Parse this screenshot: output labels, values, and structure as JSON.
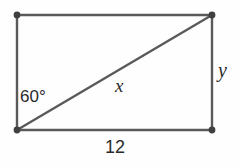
{
  "figure": {
    "type": "geometry-diagram",
    "shape": "rectangle-with-diagonal",
    "background_color": "#fefefe",
    "stroke_color": "#5a5a5a",
    "vertex_color": "#404040",
    "text_color": "#2b2b2b",
    "stroke_width": 2.4,
    "rectangle": {
      "top_left": [
        17,
        15
      ],
      "top_right": [
        212,
        15
      ],
      "bottom_right": [
        212,
        130
      ],
      "bottom_left": [
        17,
        130
      ]
    },
    "diagonal": {
      "from": [
        17,
        130
      ],
      "to": [
        212,
        15
      ]
    },
    "vertices": [
      {
        "name": "top-left",
        "x": 17,
        "y": 15
      },
      {
        "name": "top-right",
        "x": 212,
        "y": 15
      },
      {
        "name": "bottom-right",
        "x": 212,
        "y": 130
      },
      {
        "name": "bottom-left",
        "x": 17,
        "y": 130
      }
    ],
    "labels": {
      "angle": "60°",
      "base": "12",
      "diagonal": "x",
      "side": "y"
    }
  }
}
